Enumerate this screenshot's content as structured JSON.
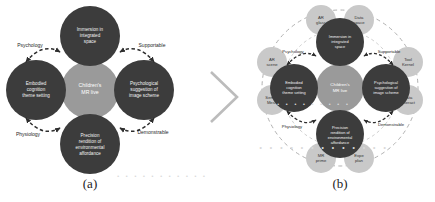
{
  "figure": {
    "panels": [
      {
        "caption": "(a)",
        "center": {
          "label": "Children's MR live",
          "lines": [
            "Children's",
            "MR live"
          ],
          "color": "#9a9a9a"
        },
        "nodes": [
          {
            "position": "top",
            "lines": [
              "Immersion in",
              "integrated",
              "space"
            ],
            "color": "#3c3c3c"
          },
          {
            "position": "left",
            "lines": [
              "Embodied",
              "cognition",
              "theme setting"
            ],
            "color": "#3c3c3c"
          },
          {
            "position": "right",
            "lines": [
              "Psychological",
              "suggestion of",
              "image scheme"
            ],
            "color": "#3c3c3c"
          },
          {
            "position": "bottom",
            "lines": [
              "Precision",
              "rendition of",
              "environmental",
              "affordance"
            ],
            "color": "#3c3c3c"
          }
        ],
        "arrow_labels": [
          {
            "position": "top-left",
            "label": "Psychology"
          },
          {
            "position": "top-right",
            "label": "Supportable"
          },
          {
            "position": "bottom-left",
            "label": "Physiology"
          },
          {
            "position": "bottom-right",
            "label": "Demonstrable"
          }
        ]
      },
      {
        "caption": "(b)",
        "center": {
          "label": "Children's MR live",
          "lines": [
            "Children's",
            "MR live"
          ],
          "color": "#9a9a9a"
        },
        "nodes": [
          {
            "position": "top",
            "lines": [
              "Immersion in",
              "integrated",
              "space"
            ],
            "color": "#3c3c3c"
          },
          {
            "position": "left",
            "lines": [
              "Embodied",
              "cognition",
              "theme setting"
            ],
            "color": "#3c3c3c"
          },
          {
            "position": "right",
            "lines": [
              "Psychological",
              "suggestion of",
              "image scheme"
            ],
            "color": "#3c3c3c"
          },
          {
            "position": "bottom",
            "lines": [
              "Precision",
              "rendition of",
              "environmental",
              "affordance"
            ],
            "color": "#3c3c3c"
          }
        ],
        "arrow_labels": [
          {
            "position": "top-left",
            "label": "Psychology"
          },
          {
            "position": "top-right",
            "label": "Supportable"
          },
          {
            "position": "bottom-left",
            "label": "Physiology"
          },
          {
            "position": "bottom-right",
            "label": "Demonstrable"
          }
        ],
        "satellites": [
          {
            "position": "top-left",
            "lines": [
              "AR",
              "glass"
            ]
          },
          {
            "position": "top-right",
            "lines": [
              "Data",
              "space"
            ]
          },
          {
            "position": "left-upper",
            "lines": [
              "AR",
              "scene"
            ]
          },
          {
            "position": "left-lower",
            "lines": [
              "Sensor",
              "Mesh"
            ]
          },
          {
            "position": "right-upper",
            "lines": [
              "Tool",
              "Kernel"
            ]
          },
          {
            "position": "right-lower",
            "lines": [
              "Data",
              "Interact"
            ]
          },
          {
            "position": "bottom-left",
            "lines": [
              "MR",
              "prime"
            ]
          },
          {
            "position": "bottom-right",
            "lines": [
              "Expe",
              "plan"
            ]
          }
        ],
        "outer_ring": {
          "style": "dashed",
          "color": "#b0b0b0"
        }
      }
    ],
    "separator": {
      "icon": "chevron-right-icon"
    },
    "palette": {
      "node_dark": "#3c3c3c",
      "center_gray": "#9a9a9a",
      "satellite_gray": "#c9c9c9",
      "arrow_dark": "#2e2e2e",
      "ring_dashed": "#b0b0b0",
      "background": "#ffffff",
      "caption_text": "#1c1c1c"
    },
    "bleed_text": {
      "line1": "· · · · · · · · · · ·",
      "line2": "· · · · · · · · ·",
      "line3": "· · · · · · · · · · · · ·"
    }
  }
}
